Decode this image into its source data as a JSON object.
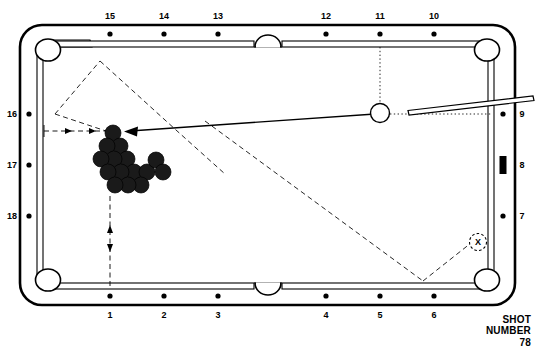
{
  "diagram": {
    "type": "pool-table-shot-diagram",
    "caption": {
      "line1": "SHOT",
      "line2": "NUMBER",
      "line3": "78"
    },
    "colors": {
      "ink": "#000000",
      "rail_fill": "#ffffff",
      "ball_fill": "#1a1a1a",
      "background": "#ffffff"
    },
    "diamond_labels": {
      "top": [
        "15",
        "14",
        "13",
        "12",
        "11",
        "10"
      ],
      "bottom": [
        "1",
        "2",
        "3",
        "4",
        "5",
        "6"
      ],
      "left": [
        "16",
        "17",
        "18"
      ],
      "right": [
        "9",
        "8",
        "7"
      ]
    },
    "markers": {
      "target_marker_label": "X",
      "target_marker_name": "cue-ball-target-position",
      "rail_marker_name": "aim-point-marker"
    },
    "objects": {
      "cue_ball": "cue-ball",
      "cue_stick": "cue-stick",
      "rack": "fifteen-ball-rack",
      "rack_ball_count": 15
    },
    "paths": {
      "shot_line": "cue-ball-to-rack-shot-line",
      "aim_guides": "dashed-aiming-guides",
      "measure_horizontal": "rack-to-left-rail-measure",
      "measure_vertical": "rack-to-foot-rail-measure",
      "position_path": "cue-ball-position-path"
    }
  }
}
